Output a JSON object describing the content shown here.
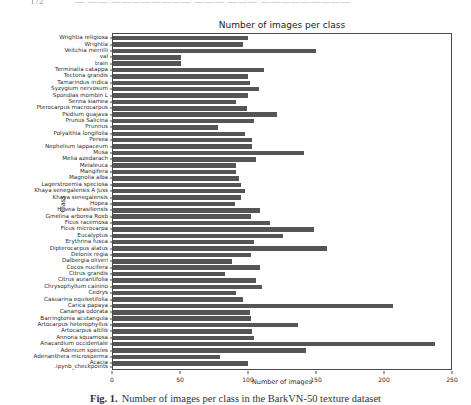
{
  "page_header": {
    "page_number": "172",
    "running_title": "— —— ———————— ——— ——— —————————"
  },
  "chart_data": {
    "type": "bar",
    "orientation": "horizontal",
    "title": "Number of images per class",
    "xlabel": "Number of images",
    "ylabel": "Class",
    "xlim": [
      0,
      250
    ],
    "xticks": [
      0,
      50,
      100,
      150,
      200,
      250
    ],
    "grid": false,
    "legend": false,
    "bar_color": "#555555",
    "categories": [
      "Wrightia religiosa",
      "Wrightia",
      "Veitchia merrilli",
      "val",
      "train",
      "Terminalia catappa",
      "Tectona grandis",
      "Tamarindus indica",
      "Syzygium nervosum",
      "Spondias mombin L",
      "Senna siamea",
      "Pterocarpus macrocarpus",
      "Psidium guajava",
      "Prunus Salicina",
      "Prunnus",
      "Polyalthia longifolia",
      "Persea",
      "Nephelium lappaceum",
      "Musa",
      "Melia azedarach",
      "Melaleuca",
      "Mangifera",
      "Magnolia alba",
      "Lagerstroemia speciosa",
      "Khaya senegalensis A Juss",
      "Khaya senegalensis",
      "Hopea",
      "Hevea brasiliensis",
      "Gmelina arborea Roxb",
      "Ficus racemosa",
      "Ficus microcarpa",
      "Eucalyptus",
      "Erythrina fusca",
      "Dipterocarpus alatus",
      "Delonix regia",
      "Dalbergia oliveri",
      "Cocos nucifera",
      "Citrus grandis",
      "Citrus aurantifolia",
      "Chrysophyllum cainino",
      "Cedrys",
      "Casuarina equisetifolia",
      "Carica papaya",
      "Cananga odorata",
      "Barringtonia acutangula",
      "Artocarpus heterophyllus",
      "Artocarpus altilis",
      "Annona squamosa",
      "Anacardium occidentale",
      "Adenium species",
      "Adenanthera microsperma",
      "Acacia",
      ".ipynb_checkpoints"
    ],
    "values": [
      100,
      96,
      150,
      50,
      50,
      112,
      100,
      101,
      108,
      100,
      91,
      99,
      121,
      104,
      78,
      98,
      103,
      103,
      141,
      106,
      91,
      91,
      93,
      95,
      98,
      95,
      90,
      109,
      102,
      116,
      149,
      126,
      104,
      158,
      102,
      88,
      109,
      83,
      106,
      110,
      91,
      96,
      207,
      101,
      102,
      137,
      103,
      104,
      238,
      143,
      79,
      100,
      0
    ]
  },
  "caption": {
    "label": "Fig. 1.",
    "text": "Number of images per class in the BarkVN-50 texture dataset"
  }
}
